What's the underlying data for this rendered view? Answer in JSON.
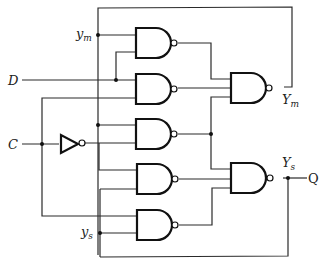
{
  "diagram": {
    "type": "logic-circuit",
    "inputs": {
      "D": "D",
      "C": "C"
    },
    "internal_signals": {
      "ym_main": "y",
      "ym_sub": "m",
      "ys_main": "y",
      "ys_sub": "s",
      "Ym_main": "Y",
      "Ym_sub": "m",
      "Ys_main": "Y",
      "Ys_sub": "s"
    },
    "output": {
      "Q": "Q"
    },
    "gates": [
      {
        "id": "nand-1",
        "type": "NAND",
        "inputs": [
          "ym",
          "D"
        ]
      },
      {
        "id": "nand-2",
        "type": "NAND",
        "inputs": [
          "D",
          "C"
        ]
      },
      {
        "id": "nand-3",
        "type": "NAND",
        "inputs": [
          "ym",
          "C'"
        ]
      },
      {
        "id": "nand-4",
        "type": "NAND",
        "inputs": [
          "C'",
          "ys"
        ]
      },
      {
        "id": "nand-5",
        "type": "NAND",
        "inputs": [
          "C",
          "ys"
        ]
      },
      {
        "id": "nand-Ym",
        "type": "NAND",
        "inputs": [
          "nand-1",
          "nand-2",
          "nand-3"
        ],
        "output": "Ym"
      },
      {
        "id": "nand-Ys",
        "type": "NAND",
        "inputs": [
          "nand-3",
          "nand-4",
          "nand-5"
        ],
        "output": "Ys = Q"
      },
      {
        "id": "inverter",
        "type": "NOT",
        "inputs": [
          "C"
        ],
        "output": "C'"
      }
    ],
    "colors": {
      "line": "#2a2a2a",
      "gate": "#111111",
      "background": "#ffffff"
    }
  }
}
